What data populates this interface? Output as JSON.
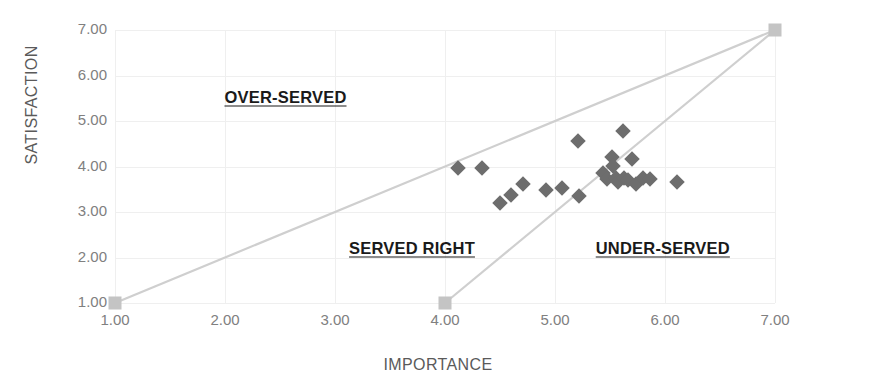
{
  "chart_data": {
    "type": "scatter",
    "title": "",
    "xlabel": "IMPORTANCE",
    "ylabel": "SATISFACTION",
    "xlim": [
      1,
      7
    ],
    "ylim": [
      1,
      7
    ],
    "grid": true,
    "legend": "none",
    "x_ticks": [
      "1.00",
      "2.00",
      "3.00",
      "4.00",
      "5.00",
      "6.00",
      "7.00"
    ],
    "y_ticks": [
      "1.00",
      "2.00",
      "3.00",
      "4.00",
      "5.00",
      "6.00",
      "7.00"
    ],
    "x_tick_values": [
      1,
      2,
      3,
      4,
      5,
      6,
      7
    ],
    "y_tick_values": [
      1,
      2,
      3,
      4,
      5,
      6,
      7
    ],
    "marker_color": "#6d6d6d",
    "marker_shape": "diamond",
    "series": [
      {
        "name": "items",
        "points": [
          {
            "x": 4.12,
            "y": 3.97
          },
          {
            "x": 4.34,
            "y": 3.97
          },
          {
            "x": 4.5,
            "y": 3.2
          },
          {
            "x": 4.6,
            "y": 3.38
          },
          {
            "x": 4.71,
            "y": 3.62
          },
          {
            "x": 4.92,
            "y": 3.48
          },
          {
            "x": 5.06,
            "y": 3.53
          },
          {
            "x": 5.22,
            "y": 3.35
          },
          {
            "x": 5.21,
            "y": 4.56
          },
          {
            "x": 5.44,
            "y": 3.86
          },
          {
            "x": 5.47,
            "y": 3.72
          },
          {
            "x": 5.52,
            "y": 4.2
          },
          {
            "x": 5.53,
            "y": 4.02
          },
          {
            "x": 5.55,
            "y": 3.75
          },
          {
            "x": 5.57,
            "y": 3.66
          },
          {
            "x": 5.62,
            "y": 4.78
          },
          {
            "x": 5.63,
            "y": 3.74
          },
          {
            "x": 5.66,
            "y": 3.7
          },
          {
            "x": 5.7,
            "y": 4.16
          },
          {
            "x": 5.74,
            "y": 3.62
          },
          {
            "x": 5.8,
            "y": 3.74
          },
          {
            "x": 5.86,
            "y": 3.72
          },
          {
            "x": 6.11,
            "y": 3.65
          }
        ]
      }
    ],
    "reference_lines": [
      {
        "name": "parity-line",
        "from": {
          "x": 1,
          "y": 1
        },
        "to": {
          "x": 7,
          "y": 7
        },
        "color": "#cfcfcf",
        "endpoint_markers": true
      },
      {
        "name": "lower-threshold-line",
        "from": {
          "x": 4,
          "y": 1
        },
        "to": {
          "x": 7,
          "y": 7
        },
        "color": "#cfcfcf",
        "endpoint_markers": true
      }
    ],
    "endpoints": [
      {
        "x": 1,
        "y": 1
      },
      {
        "x": 4,
        "y": 1
      },
      {
        "x": 7,
        "y": 7
      }
    ],
    "annotations": [
      {
        "text": "OVER-SERVED",
        "x": 2.55,
        "y": 5.52
      },
      {
        "text": "SERVED RIGHT",
        "x": 3.7,
        "y": 2.2
      },
      {
        "text": "UNDER-SERVED",
        "x": 5.98,
        "y": 2.2
      }
    ]
  }
}
